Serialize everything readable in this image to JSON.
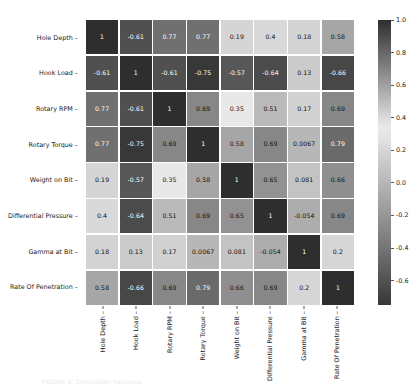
{
  "chart_data": {
    "type": "heatmap",
    "title": "",
    "xlabel": "",
    "ylabel": "",
    "categories": [
      "Hole Depth",
      "Hook Load",
      "Rotary RPM",
      "Rotary Torque",
      "Weight on Bit",
      "Differential Pressure",
      "Gamma at Bit",
      "Rate Of Penetration"
    ],
    "x_tick_labels": [
      "Hole Depth",
      "Hook Load",
      "Rotary RPM",
      "Rotary Torque",
      "Weight on Bit",
      "Differential Pressure",
      "Gamma at Bit",
      "Rate Of Penetration"
    ],
    "y_tick_labels": [
      "Hole Depth",
      "Hook Load",
      "Rotary RPM",
      "Rotary Torque",
      "Weight on Bit",
      "Differential Pressure",
      "Gamma at Bit",
      "Rate Of Penetration"
    ],
    "annotated": true,
    "grid": false,
    "colormap": "grayscale-reversed",
    "colorbar": {
      "position": "right",
      "vmin": -0.75,
      "vmax": 1.0,
      "tick_values": [
        1.0,
        0.8,
        0.6,
        0.4,
        0.2,
        0.0,
        -0.2,
        -0.4,
        -0.6
      ],
      "tick_labels": [
        "1.0",
        "0.8",
        "0.6",
        "0.4",
        "0.2",
        "0.0",
        "-0.2",
        "-0.4",
        "-0.6"
      ]
    },
    "rows": [
      {
        "label": "Hole Depth",
        "values": [
          1,
          -0.61,
          0.77,
          0.77,
          0.19,
          0.4,
          0.18,
          0.58
        ],
        "labels": [
          "1",
          "-0.61",
          "0.77",
          "0.77",
          "0.19",
          "0.4",
          "0.18",
          "0.58"
        ]
      },
      {
        "label": "Hook Load",
        "values": [
          -0.61,
          1,
          -0.61,
          -0.75,
          -0.57,
          -0.64,
          0.13,
          -0.66
        ],
        "labels": [
          "-0.61",
          "1",
          "-0.61",
          "-0.75",
          "-0.57",
          "-0.64",
          "0.13",
          "-0.66"
        ]
      },
      {
        "label": "Rotary RPM",
        "values": [
          0.77,
          -0.61,
          1,
          0.69,
          0.35,
          0.51,
          0.17,
          0.69
        ],
        "labels": [
          "0.77",
          "-0.61",
          "1",
          "0.69",
          "0.35",
          "0.51",
          "0.17",
          "0.69"
        ]
      },
      {
        "label": "Rotary Torque",
        "values": [
          0.77,
          -0.75,
          0.69,
          1,
          0.58,
          0.69,
          0.0067,
          0.79
        ],
        "labels": [
          "0.77",
          "-0.75",
          "0.69",
          "1",
          "0.58",
          "0.69",
          "0.0067",
          "0.79"
        ]
      },
      {
        "label": "Weight on Bit",
        "values": [
          0.19,
          -0.57,
          0.35,
          0.58,
          1,
          0.65,
          0.081,
          0.66
        ],
        "labels": [
          "0.19",
          "-0.57",
          "0.35",
          "0.58",
          "1",
          "0.65",
          "0.081",
          "0.66"
        ]
      },
      {
        "label": "Differential Pressure",
        "values": [
          0.4,
          -0.64,
          0.51,
          0.69,
          0.65,
          1,
          -0.054,
          0.69
        ],
        "labels": [
          "0.4",
          "-0.64",
          "0.51",
          "0.69",
          "0.65",
          "1",
          "-0.054",
          "0.69"
        ]
      },
      {
        "label": "Gamma at Bit",
        "values": [
          0.18,
          0.13,
          0.17,
          0.0067,
          0.081,
          -0.054,
          1,
          0.2
        ],
        "labels": [
          "0.18",
          "0.13",
          "0.17",
          "0.0067",
          "0.081",
          "-0.054",
          "1",
          "0.2"
        ]
      },
      {
        "label": "Rate Of Penetration",
        "values": [
          0.58,
          -0.66,
          0.69,
          0.79,
          0.66,
          0.69,
          0.2,
          1
        ],
        "labels": [
          "0.58",
          "-0.66",
          "0.69",
          "0.79",
          "0.66",
          "0.69",
          "0.2",
          "1"
        ]
      }
    ]
  },
  "caption": "FIGURE 3. Correlation heatmap"
}
